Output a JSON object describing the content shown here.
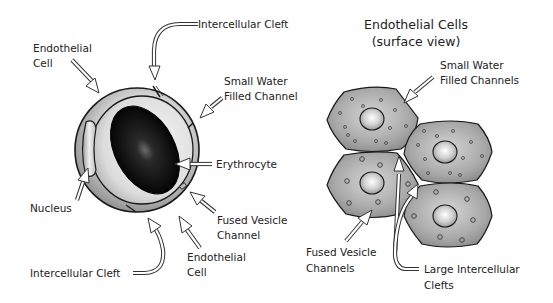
{
  "left_panel": {
    "labels": {
      "endothelial_cell_top": [
        "Endothelial",
        "Cell"
      ],
      "intercellular_cleft_top": "Intercellular Cleft",
      "small_water_filled_channel": [
        "Small Water",
        "Filled Channel"
      ],
      "erythrocyte": "Erythrocyte",
      "nucleus": "Nucleus",
      "fused_vesicle_channel": [
        "Fused Vesicle",
        "Channel"
      ],
      "endothelial_cell_bottom": [
        "Endothelial",
        "Cell"
      ],
      "intercellular_cleft_bottom": "Intercellular Cleft"
    }
  },
  "right_panel": {
    "title": [
      "Endothelial Cells",
      "(surface view)"
    ],
    "labels": {
      "small_water_filled_channels": [
        "Small Water",
        "Filled Channels"
      ],
      "fused_vesicle_channels": [
        "Fused Vesicle",
        "Channels"
      ],
      "large_intercellular_clefts": [
        "Large Intercellular",
        "Clefts"
      ]
    }
  },
  "colors": {
    "background": "#ffffff",
    "outline": "#1a1a1a",
    "cell_gray": "#8c8c8c",
    "cell_light": "#d9d9d9",
    "erythrocyte_dark": "#111111",
    "text": "#222222"
  }
}
